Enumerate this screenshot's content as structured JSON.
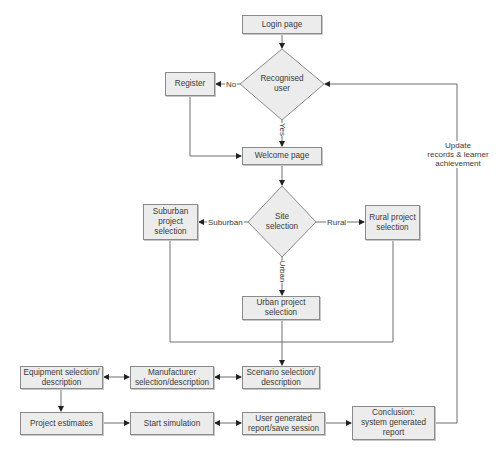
{
  "diagram": {
    "type": "flowchart",
    "nodes": {
      "login": {
        "label": "Login page",
        "shape": "rect"
      },
      "recognised": {
        "label": "Recognised\nuser",
        "shape": "diamond"
      },
      "register": {
        "label": "Register",
        "shape": "rect"
      },
      "welcome": {
        "label": "Welcome page",
        "shape": "rect"
      },
      "site": {
        "label": "Site\nselection",
        "shape": "diamond"
      },
      "suburban": {
        "label": "Suburban\nproject\nselection",
        "shape": "rect"
      },
      "rural": {
        "label": "Rural project\nselection",
        "shape": "rect"
      },
      "urban": {
        "label": "Urban project\nselection",
        "shape": "rect"
      },
      "equipment": {
        "label": "Equipment selection/\ndescription",
        "shape": "rect"
      },
      "manufacturer": {
        "label": "Manufacturer\nselection/description",
        "shape": "rect"
      },
      "scenario": {
        "label": "Scenario selection/\ndescription",
        "shape": "rect"
      },
      "estimates": {
        "label": "Project estimates",
        "shape": "rect"
      },
      "simulation": {
        "label": "Start simulation",
        "shape": "rect"
      },
      "user_report": {
        "label": "User generated\nreport/save session",
        "shape": "rect"
      },
      "conclusion": {
        "label": "Conclusion:\nsystem generated\nreport",
        "shape": "rect"
      }
    },
    "edge_labels": {
      "no": "No",
      "yes": "Yes",
      "suburban": "Suburban",
      "rural": "Rural",
      "urban": "Urban",
      "update": "Update\nrecords & learner\nachievement"
    },
    "edges": [
      {
        "from": "login",
        "to": "recognised"
      },
      {
        "from": "recognised",
        "to": "register",
        "label": "No"
      },
      {
        "from": "recognised",
        "to": "welcome",
        "label": "Yes"
      },
      {
        "from": "register",
        "to": "welcome"
      },
      {
        "from": "welcome",
        "to": "site"
      },
      {
        "from": "site",
        "to": "suburban",
        "label": "Suburban"
      },
      {
        "from": "site",
        "to": "rural",
        "label": "Rural"
      },
      {
        "from": "site",
        "to": "urban",
        "label": "Urban"
      },
      {
        "from": "suburban",
        "to": "scenario"
      },
      {
        "from": "rural",
        "to": "scenario"
      },
      {
        "from": "urban",
        "to": "scenario"
      },
      {
        "from": "equipment",
        "to": "manufacturer",
        "bidirectional": true
      },
      {
        "from": "manufacturer",
        "to": "scenario",
        "bidirectional": true
      },
      {
        "from": "equipment",
        "to": "estimates"
      },
      {
        "from": "estimates",
        "to": "simulation"
      },
      {
        "from": "simulation",
        "to": "user_report",
        "bidirectional": true
      },
      {
        "from": "user_report",
        "to": "conclusion"
      },
      {
        "from": "conclusion",
        "to": "recognised",
        "label": "Update records & learner achievement"
      }
    ],
    "colors": {
      "box_fill": "#ececec",
      "box_border": "#8a8a8a",
      "line": "#6e6e6e",
      "text": "#3a3a3a"
    }
  }
}
